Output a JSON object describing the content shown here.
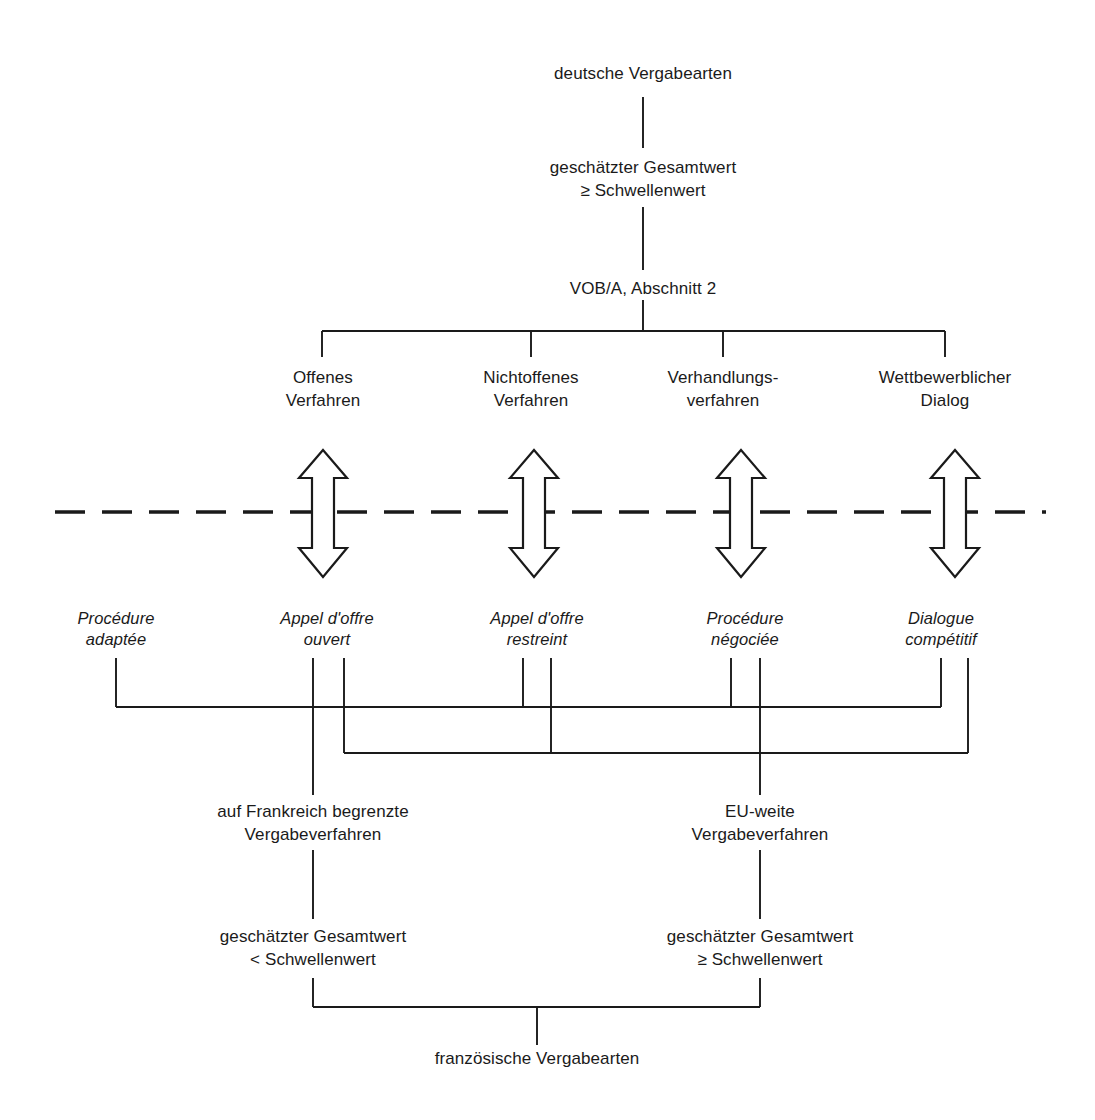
{
  "diagram": {
    "title_top": "deutsche Vergabearten",
    "title_bottom": "französische Vergabearten",
    "stroke_color": "#1a1a1a",
    "background_color": "#ffffff",
    "nodes": {
      "top": {
        "label": "deutsche Vergabearten",
        "x": 643,
        "y": 72
      },
      "threshold_de": {
        "label": "geschätzter Gesamtwert\n≥ Schwellenwert",
        "x": 643,
        "y": 155
      },
      "vob": {
        "label": "VOB/A, Abschnitt 2",
        "x": 643,
        "y": 275
      },
      "de_1": {
        "label": "Offenes\nVerfahren",
        "x": 323,
        "y": 368
      },
      "de_2": {
        "label": "Nichtoffenes\nVerfahren",
        "x": 531,
        "y": 368
      },
      "de_3": {
        "label": "Verhandlungs-\nverfahren",
        "x": 723,
        "y": 368
      },
      "de_4": {
        "label": "Wettbewerblicher\nDialog",
        "x": 945,
        "y": 368
      },
      "fr_1": {
        "label": "Procédure\nadaptée",
        "x": 116,
        "y": 612
      },
      "fr_2": {
        "label": "Appel d'offre\nouvert",
        "x": 327,
        "y": 612
      },
      "fr_3": {
        "label": "Appel d'offre\nrestreint",
        "x": 537,
        "y": 612
      },
      "fr_4": {
        "label": "Procédure\nnégociée",
        "x": 745,
        "y": 612
      },
      "fr_5": {
        "label": "Dialogue\ncompétitif",
        "x": 941,
        "y": 612
      },
      "fr_national": {
        "label": "auf Frankreich begrenzte\nVergabeverfahren",
        "x": 313,
        "y": 802
      },
      "fr_eu": {
        "label": "EU-weite\nVergabeverfahren",
        "x": 760,
        "y": 802
      },
      "threshold_fr_below": {
        "label": "geschätzter Gesamtwert\n< Schwellenwert",
        "x": 313,
        "y": 926
      },
      "threshold_fr_above": {
        "label": "geschätzter Gesamtwert\n≥ Schwellenwert",
        "x": 760,
        "y": 926
      },
      "bottom": {
        "label": "französische Vergabearten",
        "x": 537,
        "y": 1053
      }
    },
    "german_procedures": [
      "Offenes Verfahren",
      "Nichtoffenes Verfahren",
      "Verhandlungsverfahren",
      "Wettbewerblicher Dialog"
    ],
    "french_procedures": [
      "Procédure adaptée",
      "Appel d'offre ouvert",
      "Appel d'offre restreint",
      "Procédure négociée",
      "Dialogue compétitif"
    ],
    "equivalence_arrows": [
      {
        "german": "Offenes Verfahren",
        "french": "Appel d'offre ouvert",
        "x": 323
      },
      {
        "german": "Nichtoffenes Verfahren",
        "french": "Appel d'offre restreint",
        "x": 534
      },
      {
        "german": "Verhandlungsverfahren",
        "french": "Procédure négociée",
        "x": 741
      },
      {
        "german": "Wettbewerblicher Dialog",
        "french": "Dialogue compétitif",
        "x": 955
      }
    ],
    "country_divider": {
      "type": "dashed-horizontal",
      "y": 512,
      "x_start": 55,
      "x_end": 1046
    },
    "groupings": {
      "national_members": [
        "Procédure adaptée",
        "Appel d'offre ouvert",
        "Appel d'offre restreint",
        "Procédure négociée",
        "Dialogue compétitif"
      ],
      "eu_members": [
        "Appel d'offre ouvert",
        "Appel d'offre restreint",
        "Procédure négociée",
        "Dialogue compétitif"
      ]
    }
  }
}
